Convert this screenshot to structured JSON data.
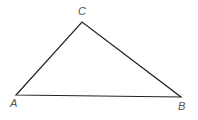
{
  "diagram": {
    "type": "triangle",
    "stroke_color": "#222222",
    "label_color": "#555555",
    "vertices": [
      {
        "name": "A",
        "x": 16,
        "y": 95,
        "label_x": 10,
        "label_y": 107
      },
      {
        "name": "B",
        "x": 181,
        "y": 97,
        "label_x": 178,
        "label_y": 110
      },
      {
        "name": "C",
        "x": 82,
        "y": 22,
        "label_x": 78,
        "label_y": 15
      }
    ],
    "edges": [
      [
        "A",
        "B"
      ],
      [
        "B",
        "C"
      ],
      [
        "C",
        "A"
      ]
    ]
  }
}
